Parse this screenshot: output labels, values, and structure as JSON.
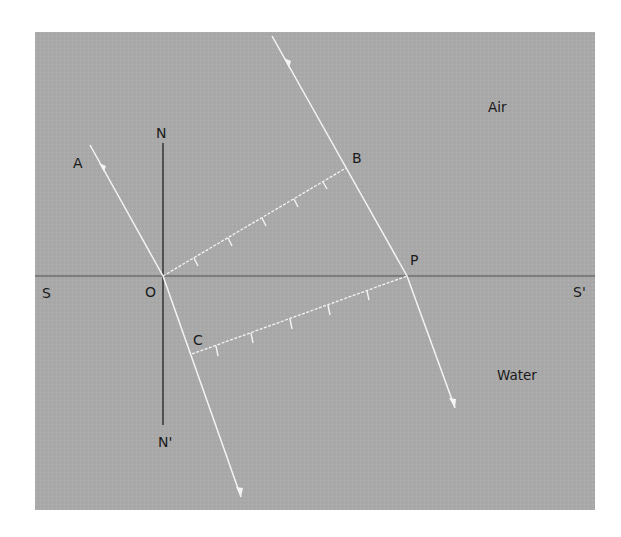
{
  "figure": {
    "type": "refraction-wavefront-diagram",
    "colors": {
      "background": "#ffffff",
      "panel": "#a9a9a9",
      "ray": "#f4f4f4",
      "normal": "#2b2b2b",
      "interface": "#6e6e6e",
      "text": "#1a1a1a"
    },
    "media": {
      "upper": "Air",
      "lower": "Water"
    },
    "labels": {
      "A": "A",
      "B": "B",
      "C": "C",
      "O": "O",
      "P": "P",
      "N": "N",
      "N_prime": "N'",
      "S": "S",
      "S_prime": "S'"
    },
    "elements": {
      "interface": "SS' (air-water boundary)",
      "normal": "NN' (normal at O)",
      "incident_rays": [
        "AO",
        "ray through B to P"
      ],
      "refracted_rays": [
        "O through C",
        "from P into water"
      ],
      "wavefronts": [
        "OB (incident wavefront in air)",
        "CP (refracted wavefront in water)"
      ],
      "wavefront_ticks_per_line": 5
    }
  }
}
